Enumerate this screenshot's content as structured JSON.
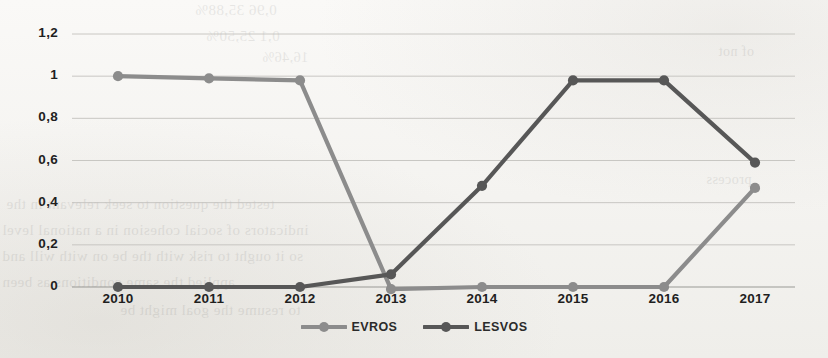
{
  "chart_data": {
    "type": "line",
    "title": "",
    "subtitle": "",
    "xlabel": "",
    "ylabel": "",
    "categories": [
      "2010",
      "2011",
      "2012",
      "2013",
      "2014",
      "2015",
      "2016",
      "2017"
    ],
    "x": [
      2010,
      2011,
      2012,
      2013,
      2014,
      2015,
      2016,
      2017
    ],
    "ylim": [
      0,
      1.2
    ],
    "ytick_labels": [
      "0",
      "0,2",
      "0,4",
      "0,6",
      "0,8",
      "1",
      "1,2"
    ],
    "ytick_values": [
      0,
      0.2,
      0.4,
      0.6,
      0.8,
      1,
      1.2
    ],
    "grid": true,
    "legend_position": "bottom",
    "decimal_separator": ",",
    "series": [
      {
        "name": "EVROS",
        "color": "#8c8c8c",
        "values": [
          1,
          0.99,
          0.98,
          -0.01,
          0,
          0,
          0,
          0.47
        ]
      },
      {
        "name": "LESVOS",
        "color": "#575757",
        "values": [
          0,
          0,
          0,
          0.06,
          0.48,
          0.98,
          0.98,
          0.59
        ]
      }
    ]
  },
  "legend": {
    "items": [
      {
        "label": "EVROS",
        "marker": "line-marker-icon",
        "color": "#8c8c8c"
      },
      {
        "label": "LESVOS",
        "marker": "line-marker-icon",
        "color": "#575757"
      }
    ]
  },
  "bleed_through": [
    {
      "text": "0,96  35,88%",
      "x": 195,
      "y": 2,
      "size": 15
    },
    {
      "text": "0,1  25,50%",
      "x": 206,
      "y": 28,
      "size": 15
    },
    {
      "text": "16,46%",
      "x": 262,
      "y": 50,
      "size": 14
    },
    {
      "text": "tested  the  question  to  seek  relevant  in the",
      "x": 6,
      "y": 196,
      "size": 15
    },
    {
      "text": "indicators  of  social  cohesion  in  a  national  level",
      "x": 2,
      "y": 222,
      "size": 15
    },
    {
      "text": "so  it  ought  to  risk  with  the  be  on  with  will and",
      "x": 2,
      "y": 248,
      "size": 15
    },
    {
      "text": "applied  the  same  conditions  as  been",
      "x": 2,
      "y": 274,
      "size": 15
    },
    {
      "text": "to  resume  the  goal  might  be",
      "x": 120,
      "y": 302,
      "size": 15
    },
    {
      "text": "of not",
      "x": 718,
      "y": 44,
      "size": 14
    },
    {
      "text": "process",
      "x": 706,
      "y": 172,
      "size": 14
    }
  ]
}
